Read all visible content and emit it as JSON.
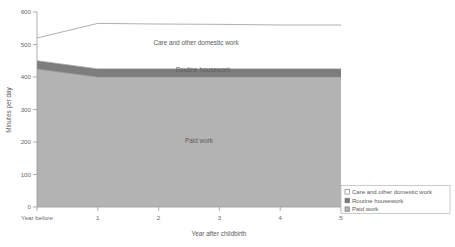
{
  "chart_data": {
    "type": "area",
    "stacked": true,
    "title": "",
    "xlabel": "Year after childbirth",
    "ylabel": "Minutes per day",
    "x": [
      0,
      1,
      2,
      3,
      4,
      5
    ],
    "categories": [
      "Year before",
      "1",
      "2",
      "3",
      "4",
      "5"
    ],
    "xtick_labels": [
      "Year before",
      "1",
      "2",
      "3",
      "4",
      "5"
    ],
    "ytick_labels": [
      "0",
      "100",
      "200",
      "300",
      "400",
      "500",
      "600"
    ],
    "ylim": [
      0,
      600
    ],
    "ytick_step": 100,
    "xlim": [
      0,
      5
    ],
    "grid": false,
    "legend_position": "bottom-right",
    "series": [
      {
        "name": "Paid work",
        "values": [
          425,
          400,
          400,
          400,
          400,
          400
        ],
        "color": "#b3b3b3",
        "inline_label": "Paid work"
      },
      {
        "name": "Routine housework",
        "values": [
          25,
          25,
          25,
          25,
          25,
          25
        ],
        "cumulative_top": [
          450,
          425,
          425,
          425,
          425,
          425
        ],
        "color": "#7d7d7d",
        "inline_label": "Routine housework"
      },
      {
        "name": "Care and other domestic work",
        "values": [
          70,
          140,
          138,
          137,
          135,
          135
        ],
        "cumulative_top": [
          520,
          565,
          563,
          562,
          560,
          560
        ],
        "color": "#ffffff",
        "inline_label": "Care and other domestic work"
      }
    ]
  },
  "legend": {
    "entries": [
      {
        "label": "Care and other domestic work",
        "color": "#ffffff"
      },
      {
        "label": "Routine housework",
        "color": "#7d7d7d"
      },
      {
        "label": "Paid work",
        "color": "#b3b3b3"
      }
    ]
  },
  "axes": {
    "y_title": "Minutes per day",
    "x_title": "Year after childbirth",
    "y_ticks": [
      "600",
      "500",
      "400",
      "300",
      "200",
      "100",
      "0"
    ],
    "x_ticks": [
      "Year before",
      "1",
      "2",
      "3",
      "4",
      "5"
    ]
  },
  "inline_labels": {
    "care": "Care and other domestic work",
    "routine": "Routine housework",
    "paid": "Paid work"
  },
  "colors": {
    "paid_work": "#b3b3b3",
    "routine_housework": "#7d7d7d",
    "care_work": "#ffffff",
    "axis": "#9a9a9a",
    "text": "#5a5a5a"
  }
}
